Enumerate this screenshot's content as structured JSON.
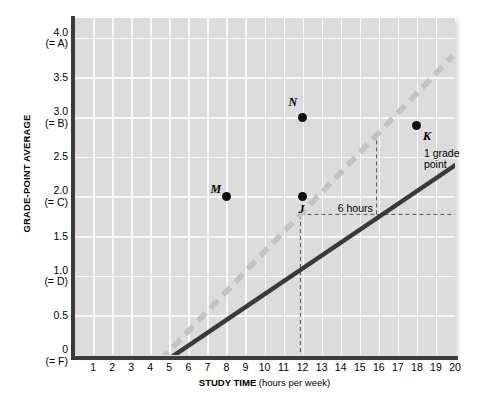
{
  "chart_data": {
    "type": "line",
    "title": "",
    "xlabel": "STUDY TIME (hours per week)",
    "xlabel_bold": "STUDY TIME",
    "xlabel_rest": "(hours per week)",
    "ylabel": "GRADE-POINT AVERAGE",
    "xlim": [
      0,
      20
    ],
    "ylim": [
      0,
      4.25
    ],
    "grid": true,
    "legend": "none",
    "xticks": [
      1,
      2,
      3,
      4,
      5,
      6,
      7,
      8,
      9,
      10,
      11,
      12,
      13,
      14,
      15,
      16,
      17,
      18,
      19,
      20
    ],
    "yticks": [
      {
        "value": 4.0,
        "label": "4.0",
        "sublabel": "(= A)"
      },
      {
        "value": 3.5,
        "label": "3.5",
        "sublabel": ""
      },
      {
        "value": 3.0,
        "label": "3.0",
        "sublabel": "(= B)"
      },
      {
        "value": 2.5,
        "label": "2.5",
        "sublabel": ""
      },
      {
        "value": 2.0,
        "label": "2.0",
        "sublabel": "(= C)"
      },
      {
        "value": 1.5,
        "label": "1.5",
        "sublabel": ""
      },
      {
        "value": 1.0,
        "label": "1.0",
        "sublabel": "(= D)"
      },
      {
        "value": 0.5,
        "label": "0.5",
        "sublabel": ""
      },
      {
        "value": 0.0,
        "label": "0",
        "sublabel": "(= F)"
      }
    ],
    "series": [
      {
        "name": "solid-line",
        "style": "solid",
        "color": "#3a3a3a",
        "x": [
          0,
          20
        ],
        "y": [
          0,
          3.25
        ],
        "slope_per_hour": 0.1625
      },
      {
        "name": "dashed-line",
        "style": "dashed",
        "color": "#c3c3c3",
        "x": [
          0,
          16
        ],
        "y": [
          0,
          4.0
        ],
        "slope_per_hour": 0.25
      }
    ],
    "points": [
      {
        "label": "M",
        "x": 8,
        "y": 2.0,
        "on": "dashed-line"
      },
      {
        "label": "N",
        "x": 12,
        "y": 3.0,
        "on": "dashed-line"
      },
      {
        "label": "J",
        "x": 12,
        "y": 2.0,
        "on": "solid-line"
      },
      {
        "label": "K",
        "x": 18,
        "y": 2.9,
        "on": "solid-line"
      }
    ],
    "annotations": [
      {
        "name": "run-annotation",
        "text": "6 hours",
        "x_from": 12,
        "x_to": 18,
        "y": 2.0
      },
      {
        "name": "rise-annotation",
        "text_line1": "1 grade",
        "text_line2": "point",
        "x": 18,
        "y_from": 2.0,
        "y_to": 2.9
      }
    ],
    "guides": [
      {
        "type": "vertical",
        "x": 8,
        "y_from": 0,
        "y_to": 2.0
      },
      {
        "type": "vertical",
        "x": 12,
        "y_from": 2.0,
        "y_to": 3.0
      },
      {
        "type": "vertical",
        "x": 18,
        "y_from": 2.0,
        "y_to": 2.9
      },
      {
        "type": "horizontal",
        "y": 2.0,
        "x_from": 8,
        "x_to": 18
      }
    ],
    "colors": {
      "plot_background": "#dcdcdc",
      "gridline": "#f7f7f7",
      "axis": "#3c3c3c",
      "solid_series": "#3a3a3a",
      "dashed_series": "#c3c3c3",
      "marker": "#111111",
      "guide": "#555555"
    }
  }
}
